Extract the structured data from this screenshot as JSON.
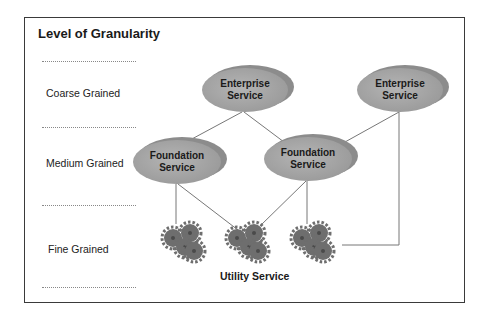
{
  "diagram": {
    "title": "Level of Granularity",
    "levels": [
      {
        "label": "Coarse Grained"
      },
      {
        "label": "Medium Grained"
      },
      {
        "label": "Fine Grained"
      }
    ],
    "nodes": {
      "enterprise_1": {
        "line1": "Enterprise",
        "line2": "Service"
      },
      "enterprise_2": {
        "line1": "Enterprise",
        "line2": "Service"
      },
      "foundation_1": {
        "line1": "Foundation",
        "line2": "Service"
      },
      "foundation_2": {
        "line1": "Foundation",
        "line2": "Service"
      }
    },
    "utility_label": "Utility Service",
    "colors": {
      "ellipse_fill": "#a9a9a9",
      "ellipse_shadow": "#8c8c8c",
      "gear_fill": "#6e6e6e",
      "line": "#777777",
      "frame": "#3a3a3a"
    }
  }
}
